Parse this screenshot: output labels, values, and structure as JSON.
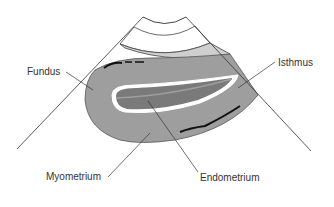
{
  "diagram": {
    "type": "ultrasound-sector-schematic",
    "labels": {
      "fundus": "Fundus",
      "isthmus": "Isthmus",
      "myometrium": "Myometrium",
      "endometrium": "Endometrium"
    },
    "colors": {
      "near_field_band": "#cfcfcf",
      "myometrium": "#9e9e9e",
      "endometrium": "#7a7a7a",
      "cavity_outline": "#ffffff",
      "vessels": "#111111",
      "lines": "#333333",
      "background": "#ffffff"
    }
  }
}
